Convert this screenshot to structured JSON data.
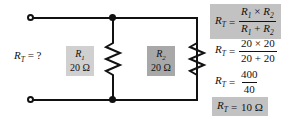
{
  "diagram": {
    "unknown_label": "R<sub>T</sub> = ?",
    "colors": {
      "wire": "#111111",
      "label_box_light": "#d0d0d0",
      "label_box_dark": "#a8a8a8",
      "equation_box": "#c2c2c2",
      "text": "#111111"
    }
  },
  "circuit": {
    "terminals": [
      {
        "name": "top-left-terminal",
        "position": "top"
      },
      {
        "name": "bottom-left-terminal",
        "position": "bottom"
      }
    ],
    "nodes": [
      {
        "name": "top-junction"
      },
      {
        "name": "bottom-junction"
      }
    ],
    "components": [
      {
        "id": "R1",
        "symbol": "resistor-zigzag",
        "name_label": "R<sub>1</sub>",
        "value_label": "20 Ω",
        "value": 20,
        "unit": "Ω"
      },
      {
        "id": "R2",
        "symbol": "resistor-zigzag",
        "name_label": "R<sub>2</sub>",
        "value_label": "20 Ω",
        "value": 20,
        "unit": "Ω"
      }
    ]
  },
  "equations": [
    {
      "id": "formula",
      "highlighted": true,
      "lhs": "R<sub>T</sub>",
      "operator": "=",
      "numerator": "R<sub>1</sub> × R<sub>2</sub>",
      "denominator": "R<sub>1</sub> + R<sub>2</sub>"
    },
    {
      "id": "substitution",
      "highlighted": false,
      "lhs": "R<sub>T</sub>",
      "operator": "=",
      "numerator": "20 × 20",
      "denominator": "20 + 20"
    },
    {
      "id": "reduction",
      "highlighted": false,
      "lhs": "R<sub>T</sub>",
      "operator": "=",
      "numerator": "400",
      "denominator": "40"
    },
    {
      "id": "result",
      "highlighted": true,
      "lhs": "R<sub>T</sub>",
      "operator": "=",
      "result": "10 Ω"
    }
  ]
}
